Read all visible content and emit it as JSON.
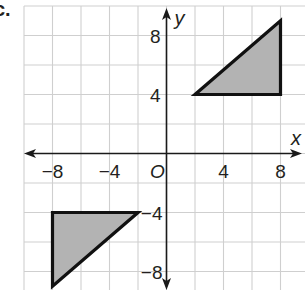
{
  "problem_label": "c.",
  "chart_data": {
    "type": "scatter",
    "title": "",
    "xlabel": "x",
    "ylabel": "y",
    "xlim": [
      -10,
      9.7
    ],
    "ylim": [
      -9.3,
      10
    ],
    "grid": true,
    "grid_step": 2,
    "origin_label": "O",
    "x_ticks": [
      -8,
      -4,
      4,
      8
    ],
    "x_tick_labels": [
      "−8",
      "−4",
      "4",
      "8"
    ],
    "y_ticks": [
      8,
      4,
      -4,
      -8
    ],
    "y_tick_labels": [
      "8",
      "4",
      "−4",
      "−8"
    ],
    "shapes": [
      {
        "name": "triangle-quadrant-I",
        "type": "polygon",
        "fill": "#b3b3b3",
        "vertices": [
          [
            2,
            4
          ],
          [
            8,
            4
          ],
          [
            8,
            9
          ]
        ]
      },
      {
        "name": "triangle-quadrant-III",
        "type": "polygon",
        "fill": "#b3b3b3",
        "vertices": [
          [
            -8,
            -4
          ],
          [
            -2,
            -4
          ],
          [
            -8,
            -9
          ]
        ]
      }
    ]
  },
  "colors": {
    "grid": "#cfcfcf",
    "axis": "#1a1a1a",
    "shape_fill": "#b3b3b3",
    "shape_stroke": "#111111"
  }
}
